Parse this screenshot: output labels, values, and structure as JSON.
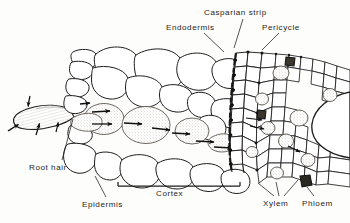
{
  "figure": {
    "style": "monochrome ink line drawing",
    "background_color": "#fdfdfc",
    "line_color": "#1d1d1d",
    "shaded_cell_color": "#d8d4cc",
    "width": 350,
    "height": 223
  },
  "labels": {
    "casparian_strip": "Casparian strip",
    "endodermis": "Endodermis",
    "pericycle": "Pericycle",
    "root_hair": "Root hair",
    "epidermis": "Epidermis",
    "cortex": "Cortex",
    "xylem": "Xylem",
    "phloem": "Phloem"
  },
  "structures": [
    {
      "name": "root-hair",
      "description": "elongated tubular outgrowth extending left from an epidermal cell",
      "label": "Root hair"
    },
    {
      "name": "epidermis",
      "description": "outermost single layer of cells bearing the root hair",
      "label": "Epidermis"
    },
    {
      "name": "cortex",
      "description": "broad zone of large rounded parenchyma cells between epidermis and endodermis",
      "label": "Cortex"
    },
    {
      "name": "endodermis",
      "description": "single vertical file of cells bounding the stele",
      "label": "Endodermis"
    },
    {
      "name": "casparian-strip",
      "description": "dark suberized band along radial walls of endodermal cells",
      "label": "Casparian strip"
    },
    {
      "name": "pericycle",
      "description": "cell layer immediately inside the endodermis",
      "label": "Pericycle"
    },
    {
      "name": "xylem",
      "description": "shaded water-conducting vessel cells within the stele",
      "label": "Xylem"
    },
    {
      "name": "phloem",
      "description": "dark-filled sieve cells within the stele",
      "label": "Phloem"
    }
  ],
  "annotations": {
    "flow_arrows": "black arrows indicating water movement inward from root hair across cortex to stele",
    "cortex_bracket": "horizontal bracket spanning the cortex region"
  }
}
